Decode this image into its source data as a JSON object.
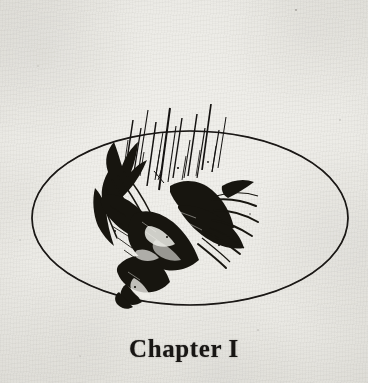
{
  "page": {
    "kind": "book-page-scan",
    "background_color": "#e9e8e4",
    "ink_color": "#1a1816",
    "width": 368,
    "height": 383
  },
  "heading": {
    "text": "Chapter I",
    "style": "bold-serif",
    "color": "#181614"
  },
  "vignette": {
    "frame_shape": "ellipse",
    "frame_stroke_color": "#141210",
    "frame_center_x": 190,
    "frame_center_y": 218,
    "frame_radius_x": 158,
    "frame_radius_y": 87,
    "frame_stroke_width": 1.6,
    "subject": "falling-bird",
    "subject_description": "pen-and-ink drawing of a bird plummeting head-down with outspread wings",
    "motion_lines_count": 22,
    "motion_lines_color": "#141210"
  },
  "icons": {
    "ellipse_frame": "ellipse-frame-icon",
    "bird": "falling-bird-icon",
    "motion_lines": "motion-lines-icon"
  }
}
